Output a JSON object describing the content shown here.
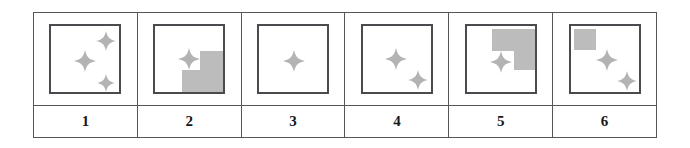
{
  "figure": {
    "type": "table",
    "caption": "",
    "columns": 6,
    "rows": 2,
    "background_color": "#ffffff",
    "border_color": "#55565a",
    "box_border_color": "#4a4b4f",
    "shade_color": "#bcbcbc",
    "star_color": "#b3b3b3"
  },
  "cells": [
    {
      "id": "cell-1",
      "label": "1",
      "shade_name": "none",
      "shade_polygon": "",
      "stars": [
        {
          "name": "star-center",
          "cx": 34,
          "cy": 35,
          "r": 11
        },
        {
          "name": "star-top-right",
          "cx": 55,
          "cy": 15,
          "r": 10
        },
        {
          "name": "star-bottom-right",
          "cx": 55,
          "cy": 57,
          "r": 9
        }
      ]
    },
    {
      "id": "cell-2",
      "label": "2",
      "shade_name": "staircase-bottom-right",
      "shade_polygon": "27,68 27,44 45,44 45,25 69,25 69,68",
      "stars": [
        {
          "name": "star-center",
          "cx": 34,
          "cy": 33,
          "r": 11
        }
      ]
    },
    {
      "id": "cell-3",
      "label": "3",
      "shade_name": "none",
      "shade_polygon": "",
      "stars": [
        {
          "name": "star-center",
          "cx": 35,
          "cy": 35,
          "r": 11
        }
      ]
    },
    {
      "id": "cell-4",
      "label": "4",
      "shade_name": "none",
      "shade_polygon": "",
      "stars": [
        {
          "name": "star-center",
          "cx": 33,
          "cy": 33,
          "r": 11
        },
        {
          "name": "star-bottom-right",
          "cx": 55,
          "cy": 54,
          "r": 10
        }
      ]
    },
    {
      "id": "cell-5",
      "label": "5",
      "shade_name": "L-shape-top-right",
      "shade_polygon": "25,3 69,3 69,44 47,44 47,25 25,25",
      "stars": [
        {
          "name": "star-center",
          "cx": 34,
          "cy": 36,
          "r": 11
        }
      ]
    },
    {
      "id": "cell-6",
      "label": "6",
      "shade_name": "square-top-left",
      "shade_polygon": "3,3 25,3 25,24 3,24",
      "stars": [
        {
          "name": "star-center",
          "cx": 36,
          "cy": 34,
          "r": 11
        },
        {
          "name": "star-bottom-right",
          "cx": 56,
          "cy": 55,
          "r": 10
        }
      ]
    }
  ]
}
